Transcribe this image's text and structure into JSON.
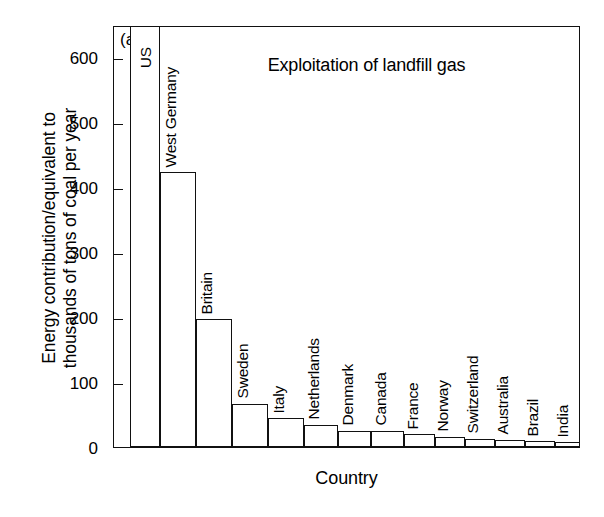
{
  "panel_label": "(a)",
  "xlabel": "Country",
  "ylabel_line1": "Energy contribution/equivalent to",
  "ylabel_line2": "thousands of tons of coal per year",
  "chart_data": {
    "type": "bar",
    "title": "Exploitation of landfill gas",
    "xlabel": "Country",
    "ylabel": "Energy contribution/equivalent to thousands of tons of coal per year",
    "ylim": [
      0,
      650
    ],
    "yticks": [
      0,
      100,
      200,
      300,
      400,
      500,
      600
    ],
    "ytick_labels": [
      "0",
      "100",
      "200",
      "300",
      "400",
      "500",
      "600"
    ],
    "grid": false,
    "legend": "none",
    "note": "US bar is clipped by the top of the axes frame (value exceeds plotted range)",
    "categories": [
      "US",
      "West Germany",
      "Britain",
      "Sweden",
      "Italy",
      "Netherlands",
      "Denmark",
      "Canada",
      "France",
      "Norway",
      "Switzerland",
      "Australia",
      "Brazil",
      "India",
      "Chile"
    ],
    "values": [
      680,
      423,
      197,
      67,
      44,
      34,
      25,
      25,
      20,
      16,
      13,
      11,
      9,
      7,
      5
    ],
    "clipped": [
      true,
      false,
      false,
      false,
      false,
      false,
      false,
      false,
      false,
      false,
      false,
      false,
      false,
      false,
      false
    ]
  },
  "colors": {
    "axis": "#111111",
    "bar_fill": "#ffffff",
    "bar_stroke": "#111111",
    "text": "#000000",
    "background": "#ffffff"
  }
}
